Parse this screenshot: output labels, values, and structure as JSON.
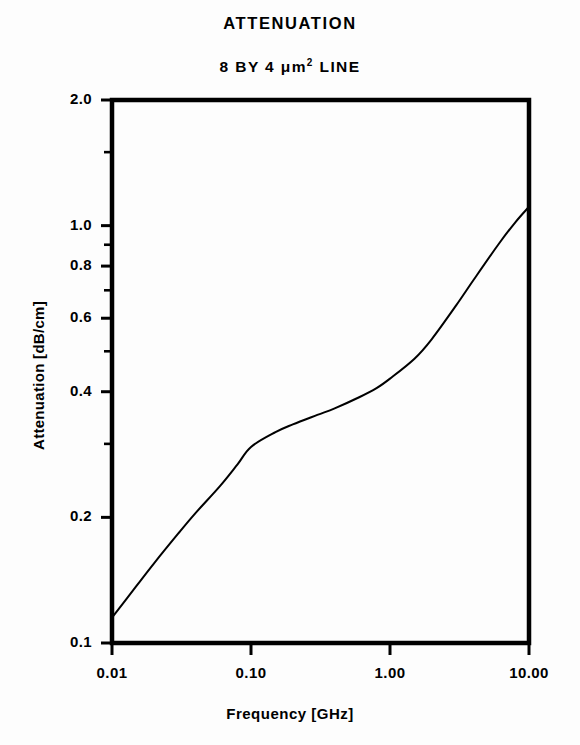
{
  "chart_data": {
    "type": "line",
    "title": "ATTENUATION",
    "subtitle": "8 BY 4 μm² LINE",
    "xlabel": "Frequency [GHz]",
    "ylabel": "Attenuation [dB/cm]",
    "xscale": "log",
    "yscale": "log",
    "xlim": [
      0.01,
      10.0
    ],
    "ylim": [
      0.1,
      2.0
    ],
    "grid": false,
    "legend": null,
    "xticks": [
      0.01,
      0.1,
      1.0,
      10.0
    ],
    "xtick_labels": [
      "0.01",
      "0.10",
      "1.00",
      "10.00"
    ],
    "yticks": [
      0.1,
      0.2,
      0.4,
      0.6,
      0.8,
      1.0,
      2.0
    ],
    "ytick_labels": [
      "0.1",
      "0.2",
      "0.4",
      "0.6",
      "0.8",
      "1.0",
      "2.0"
    ],
    "y_minor_ticks": [
      0.3,
      0.5,
      0.7,
      0.9,
      1.5
    ],
    "line_color": "#000000",
    "line_width": 2,
    "series": [
      {
        "name": "attenuation",
        "x": [
          0.01,
          0.015,
          0.02,
          0.03,
          0.04,
          0.06,
          0.08,
          0.1,
          0.15,
          0.2,
          0.3,
          0.4,
          0.6,
          0.8,
          1.0,
          1.5,
          2.0,
          3.0,
          4.0,
          6.0,
          8.0,
          10.0
        ],
        "y": [
          0.115,
          0.137,
          0.155,
          0.183,
          0.205,
          0.238,
          0.268,
          0.295,
          0.32,
          0.334,
          0.352,
          0.365,
          0.388,
          0.408,
          0.43,
          0.48,
          0.535,
          0.645,
          0.742,
          0.9,
          1.02,
          1.11
        ]
      }
    ]
  },
  "axes": {
    "frame_color": "#000000"
  }
}
